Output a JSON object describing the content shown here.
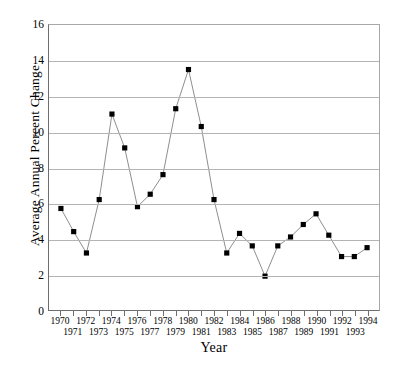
{
  "chart_data": {
    "type": "line",
    "title": "",
    "xlabel": "Year",
    "ylabel": "Average Annual Percent Change",
    "x": [
      1970,
      1971,
      1972,
      1973,
      1974,
      1975,
      1976,
      1977,
      1978,
      1979,
      1980,
      1981,
      1982,
      1983,
      1984,
      1985,
      1986,
      1987,
      1988,
      1989,
      1990,
      1991,
      1992,
      1993,
      1994
    ],
    "categories": [
      "1970",
      "1971",
      "1972",
      "1973",
      "1974",
      "1975",
      "1976",
      "1977",
      "1978",
      "1979",
      "1980",
      "1981",
      "1982",
      "1983",
      "1984",
      "1985",
      "1986",
      "1987",
      "1988",
      "1989",
      "1990",
      "1991",
      "1992",
      "1993",
      "1994"
    ],
    "values": [
      5.7,
      4.4,
      3.2,
      6.2,
      11.0,
      9.1,
      5.8,
      6.5,
      7.6,
      11.3,
      13.5,
      10.3,
      6.2,
      3.2,
      4.3,
      3.6,
      1.9,
      3.6,
      4.1,
      4.8,
      5.4,
      4.2,
      3.0,
      3.0,
      3.5
    ],
    "series": [
      {
        "name": "Average Annual Percent Change",
        "values": [
          5.7,
          4.4,
          3.2,
          6.2,
          11.0,
          9.1,
          5.8,
          6.5,
          7.6,
          11.3,
          13.5,
          10.3,
          6.2,
          3.2,
          4.3,
          3.6,
          1.9,
          3.6,
          4.1,
          4.8,
          5.4,
          4.2,
          3.0,
          3.0,
          3.5
        ]
      }
    ],
    "ylim": [
      0,
      16
    ],
    "xlim": [
      1970,
      1994
    ],
    "yticks": [
      0,
      2,
      4,
      6,
      8,
      10,
      12,
      14,
      16
    ],
    "ytick_labels": [
      "0",
      "2",
      "4",
      "6",
      "8",
      "10",
      "12",
      "14",
      "16"
    ],
    "grid": true,
    "grid_axis": "y",
    "legend": false,
    "legend_position": "none",
    "marker": "square",
    "marker_color": "#000000",
    "line_color": "#808080",
    "background_color": "#ffffff",
    "axis_color": "#6e6e6e",
    "gridline_color": "#b4b4b4"
  }
}
